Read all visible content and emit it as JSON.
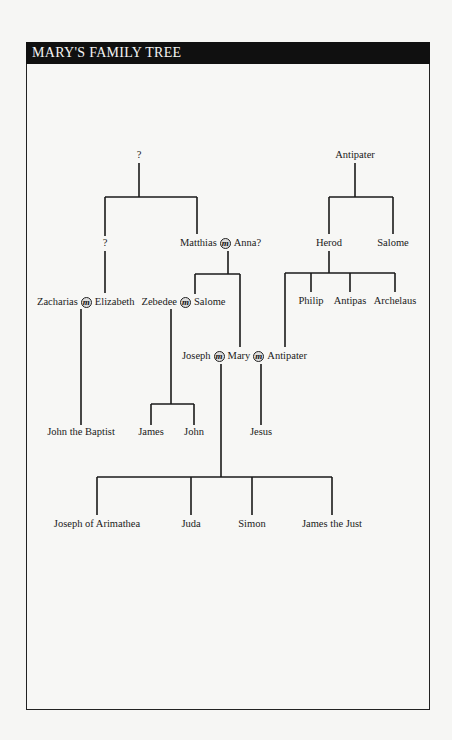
{
  "title": "MARY'S FAMILY TREE",
  "marriage_symbol": "m",
  "nodes": {
    "unknown_root": "?",
    "unknown_child": "?",
    "antipater_elder": "Antipater",
    "herod": "Herod",
    "salome_herod_sister": "Salome",
    "philip": "Philip",
    "antipas": "Antipas",
    "archelaus": "Archelaus",
    "matthias": "Matthias",
    "anna": "Anna?",
    "zacharias": "Zacharias",
    "elizabeth": "Elizabeth",
    "zebedee": "Zebedee",
    "salome": "Salome",
    "joseph": "Joseph",
    "mary": "Mary",
    "antipater_younger": "Antipater",
    "john_the_baptist": "John the Baptist",
    "james": "James",
    "john": "John",
    "jesus": "Jesus",
    "joseph_of_arimathea": "Joseph of Arimathea",
    "juda": "Juda",
    "simon": "Simon",
    "james_the_just": "James the Just"
  },
  "marriages": [
    [
      "Matthias",
      "Anna?"
    ],
    [
      "Zacharias",
      "Elizabeth"
    ],
    [
      "Zebedee",
      "Salome"
    ],
    [
      "Joseph",
      "Mary"
    ],
    [
      "Mary",
      "Antipater"
    ]
  ],
  "colors": {
    "header_bg": "#101010",
    "header_text": "#f4f4f4",
    "line": "#1a1a1a",
    "page_bg": "#f6f6f4"
  }
}
